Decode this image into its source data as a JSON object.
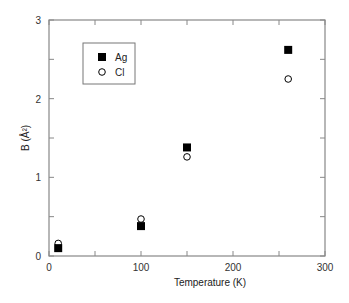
{
  "chart_data": {
    "type": "scatter",
    "title": "",
    "xlabel": "Temperature (K)",
    "ylabel": "B (Å²)",
    "xlim": [
      0,
      300
    ],
    "ylim": [
      0,
      3
    ],
    "x_ticks": [
      0,
      100,
      200,
      300
    ],
    "x_tick_labels": [
      "0",
      "100",
      "200",
      "300"
    ],
    "y_ticks": [
      0,
      1,
      2,
      3
    ],
    "y_tick_labels": [
      "0",
      "1",
      "2",
      "3"
    ],
    "grid": false,
    "legend_position": "upper-left (inside)",
    "series": [
      {
        "name": "Ag",
        "marker": "filled-square",
        "x": [
          10,
          100,
          150,
          260
        ],
        "y": [
          0.1,
          0.38,
          1.38,
          2.62
        ]
      },
      {
        "name": "Cl",
        "marker": "open-circle",
        "x": [
          10,
          100,
          150,
          260
        ],
        "y": [
          0.16,
          0.47,
          1.26,
          2.25
        ]
      }
    ]
  },
  "colors": {
    "axis": "#888888",
    "marker": "#000000"
  }
}
